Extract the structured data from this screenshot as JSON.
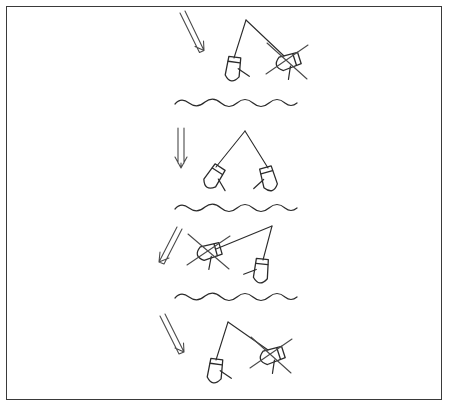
{
  "document": {
    "title": "Boat Positioning Relative To Wind",
    "medium": "hand-drawn line sketch",
    "ink_color": "#2b2b2b",
    "background_color": "#ffffff",
    "border_color": "#3a3a3a"
  },
  "frame": {
    "x": 6,
    "y": 6,
    "width": 436,
    "height": 394,
    "stroke_width": 1
  },
  "legend": {
    "arrow_meaning": "wind direction",
    "wave_meaning": "water surface divider",
    "cross_meaning": "incorrect boat position",
    "plain_boat_meaning": "correct boat position"
  },
  "panels": [
    {
      "id": "panel-1",
      "index": 1,
      "arrow": {
        "name": "wind-arrow",
        "direction": "down-right",
        "angle_degrees": 62,
        "x1": 182,
        "y1": 14,
        "x2": 201,
        "y2": 54
      },
      "apex": {
        "x": 246,
        "y": 20
      },
      "boats": [
        {
          "name": "boat-left",
          "x": 233,
          "y": 70,
          "rotation": 8,
          "status": "correct",
          "crossed_out": false
        },
        {
          "name": "boat-right",
          "x": 287,
          "y": 62,
          "rotation": 72,
          "status": "incorrect",
          "crossed_out": true
        }
      ],
      "wave": {
        "name": "water-line",
        "y": 104,
        "x_start": 175,
        "x_end": 297
      }
    },
    {
      "id": "panel-2",
      "index": 2,
      "arrow": {
        "name": "wind-arrow",
        "direction": "down",
        "angle_degrees": 90,
        "x1": 181,
        "y1": 129,
        "x2": 181,
        "y2": 165
      },
      "apex": {
        "x": 245,
        "y": 131
      },
      "boats": [
        {
          "name": "boat-left",
          "x": 213,
          "y": 178,
          "rotation": 33,
          "status": "correct",
          "crossed_out": false
        },
        {
          "name": "boat-right",
          "x": 269,
          "y": 180,
          "rotation": -16,
          "status": "correct",
          "crossed_out": false
        }
      ],
      "wave": {
        "name": "water-line",
        "y": 209,
        "x_start": 175,
        "x_end": 297
      }
    },
    {
      "id": "panel-3",
      "index": 3,
      "arrow": {
        "name": "wind-arrow",
        "direction": "down-left",
        "angle_degrees": 118,
        "x1": 176,
        "y1": 228,
        "x2": 159,
        "y2": 264
      },
      "apex": {
        "x": 272,
        "y": 226
      },
      "boats": [
        {
          "name": "boat-left",
          "x": 208,
          "y": 252,
          "rotation": 74,
          "status": "incorrect",
          "crossed_out": true
        },
        {
          "name": "boat-right",
          "x": 261,
          "y": 272,
          "rotation": 6,
          "status": "correct",
          "crossed_out": false
        }
      ],
      "wave": {
        "name": "water-line",
        "y": 298,
        "x_start": 175,
        "x_end": 297
      }
    },
    {
      "id": "panel-4",
      "index": 4,
      "arrow": {
        "name": "wind-arrow",
        "direction": "down-right",
        "angle_degrees": 62,
        "x1": 162,
        "y1": 317,
        "x2": 181,
        "y2": 355
      },
      "apex": {
        "x": 228,
        "y": 322
      },
      "boats": [
        {
          "name": "boat-left",
          "x": 215,
          "y": 372,
          "rotation": 8,
          "status": "correct",
          "crossed_out": false
        },
        {
          "name": "boat-right",
          "x": 271,
          "y": 356,
          "rotation": 72,
          "status": "incorrect",
          "crossed_out": true
        }
      ],
      "wave": null
    }
  ]
}
